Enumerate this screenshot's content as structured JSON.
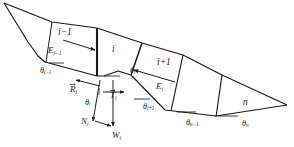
{
  "figure": {
    "background_color": "#ffffff",
    "line_color": "#1a1a1a"
  },
  "slices": [
    {
      "id": "slice-i-minus-1",
      "label": "i−1",
      "x": 58,
      "y": 28
    },
    {
      "id": "slice-i",
      "label": "i",
      "x": 112,
      "y": 45
    },
    {
      "id": "slice-i-plus-1",
      "label": "i+1",
      "x": 157,
      "y": 58
    },
    {
      "id": "slice-n",
      "label": "n",
      "x": 243,
      "y": 98
    }
  ],
  "interslice_forces": [
    {
      "id": "force-E-i-minus-1",
      "symbol": "E",
      "subscript": "i−1",
      "x": 48,
      "y": 46
    },
    {
      "id": "force-E-i",
      "symbol": "E",
      "subscript": "i",
      "x": 156,
      "y": 82
    }
  ],
  "base_forces": [
    {
      "id": "force-R-i",
      "symbol": "R",
      "subscript": "i",
      "x": 70,
      "y": 85,
      "vector": true
    },
    {
      "id": "force-T-i",
      "symbol": "T",
      "subscript": "i",
      "x": 110,
      "y": 91,
      "vector": true
    },
    {
      "id": "force-N-i",
      "symbol": "N",
      "subscript": "i",
      "x": 81,
      "y": 117,
      "vector": false
    },
    {
      "id": "force-W-i",
      "symbol": "W",
      "subscript": "i",
      "x": 112,
      "y": 131,
      "vector": false
    }
  ],
  "angles": [
    {
      "id": "angle-theta-i-minus-1",
      "symbol": "θ",
      "subscript": "i−1",
      "x": 40,
      "y": 67
    },
    {
      "id": "angle-theta-i-base",
      "symbol": "θ",
      "subscript": "i",
      "x": 130,
      "y": 67
    },
    {
      "id": "angle-theta-i-res",
      "symbol": "θ",
      "subscript": "i",
      "x": 85,
      "y": 99
    },
    {
      "id": "angle-theta-i-plus-1",
      "symbol": "θ",
      "subscript": "i+1",
      "x": 143,
      "y": 103
    },
    {
      "id": "angle-theta-n-minus-1",
      "symbol": "θ",
      "subscript": "n−1",
      "x": 186,
      "y": 119
    },
    {
      "id": "angle-theta-n",
      "symbol": "θ",
      "subscript": "n",
      "x": 242,
      "y": 120
    }
  ]
}
